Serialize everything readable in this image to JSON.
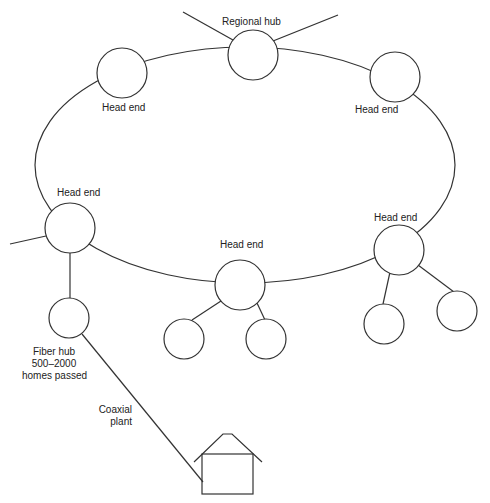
{
  "diagram": {
    "nodes": [
      {
        "id": "regional-hub",
        "label": "Regional hub"
      },
      {
        "id": "head-end-top-left",
        "label": "Head end"
      },
      {
        "id": "head-end-top-right",
        "label": "Head end"
      },
      {
        "id": "head-end-left",
        "label": "Head end"
      },
      {
        "id": "head-end-bottom",
        "label": "Head end"
      },
      {
        "id": "head-end-right",
        "label": "Head end"
      },
      {
        "id": "fiber-hub",
        "label_lines": [
          "Fiber hub",
          "500–2000",
          "homes passed"
        ]
      },
      {
        "id": "house",
        "label": ""
      }
    ],
    "edge_labels": {
      "coax_lines": [
        "Coaxial",
        "plant"
      ]
    },
    "colors": {
      "line": "#333333",
      "background": "#ffffff",
      "text": "#222222"
    }
  }
}
